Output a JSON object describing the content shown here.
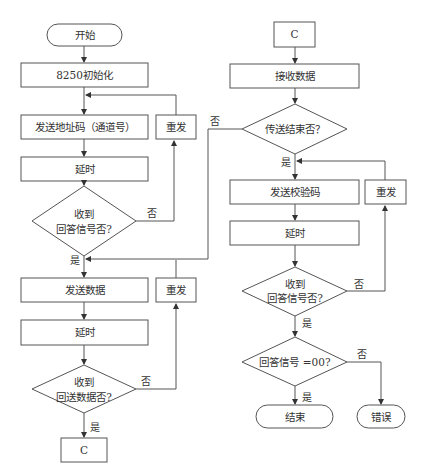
{
  "diagram": {
    "type": "flowchart",
    "language": "zh",
    "left_column": {
      "start": "开始",
      "init": "8250初始化",
      "send_address": "发送地址码（通道号）",
      "retry_1": "重发",
      "delay_1": "延时",
      "decision_1": {
        "line1": "收到",
        "line2": "回答信号否?"
      },
      "send_data": "发送数据",
      "retry_2": "重发",
      "delay_2": "延时",
      "decision_2": {
        "line1": "收到",
        "line2": "回送数据否?"
      },
      "connector_out": "C"
    },
    "right_column": {
      "connector_in": "C",
      "receive_data": "接收数据",
      "decision_end": "传送结束否？",
      "send_checksum": "发送校验码",
      "retry_3": "重发",
      "delay_3": "延时",
      "decision_3": {
        "line1": "收到",
        "line2": "回答信号否?"
      },
      "decision_4": "回答信号 =00?",
      "end": "结束",
      "error": "错误"
    },
    "edge_labels": {
      "yes": "是",
      "no": "否"
    },
    "colors": {
      "stroke": "#555555",
      "text": "#333333",
      "background": "#ffffff"
    }
  }
}
